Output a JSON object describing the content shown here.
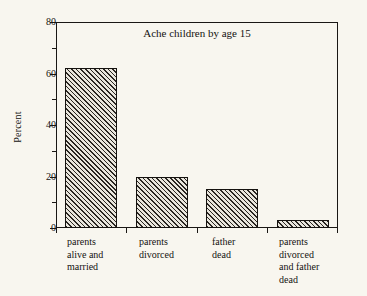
{
  "chart_data": {
    "type": "bar",
    "title": "Ache children by age 15",
    "xlabel": "",
    "ylabel": "Percent",
    "categories": [
      "parents\nalive and\nmarried",
      "parents\ndivorced",
      "father\ndead",
      "parents\ndivorced\nand father\ndead"
    ],
    "values": [
      62,
      20,
      15,
      3
    ],
    "ylim": [
      0,
      80
    ],
    "yticks": [
      0,
      20,
      40,
      60,
      80
    ],
    "ytick_labels": [
      "0",
      "20",
      "40",
      "60",
      "80"
    ],
    "yminor_ticks": [
      10,
      30,
      50,
      70
    ],
    "grid": false,
    "legend": null,
    "bar_fill": "diagonal-hatch",
    "colors": {
      "background": "#f8f6ef",
      "axis": "#1a1714",
      "bar_edge": "#15120f",
      "bar_hatch": "#2a2622",
      "text": "#141210"
    }
  },
  "axes": {
    "y_title": "Percent",
    "y_tick_0": "0",
    "y_tick_1": "20",
    "y_tick_2": "40",
    "y_tick_3": "60",
    "y_tick_4": "80"
  },
  "title": "Ache children by age 15",
  "categories": {
    "c0": "parents\nalive and\nmarried",
    "c1": "parents\ndivorced",
    "c2": "father\ndead",
    "c3": "parents\ndivorced\nand father\ndead"
  }
}
